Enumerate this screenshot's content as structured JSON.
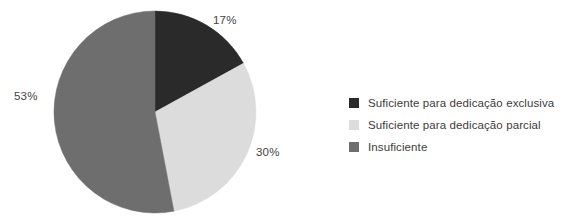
{
  "chart_data": {
    "type": "pie",
    "title": "",
    "subtitle": "",
    "xlabel": "",
    "ylabel": "",
    "grid": false,
    "legend_position": "right",
    "start_angle_deg": 0,
    "direction": "clockwise",
    "categories": [
      "Suficiente para dedicação exclusiva",
      "Suficiente para dedicação parcial",
      "Insuficiente"
    ],
    "values": [
      17,
      30,
      53
    ],
    "value_labels": [
      "17%",
      "30%",
      "53%"
    ],
    "colors": [
      "#2a2a2a",
      "#dcdcdc",
      "#6e6e6e"
    ],
    "annotations": []
  },
  "legend": {
    "items": [
      {
        "label": "Suficiente para dedicação exclusiva",
        "color": "#2a2a2a"
      },
      {
        "label": "Suficiente para dedicação parcial",
        "color": "#dcdcdc"
      },
      {
        "label": "Insuficiente",
        "color": "#6e6e6e"
      }
    ]
  }
}
